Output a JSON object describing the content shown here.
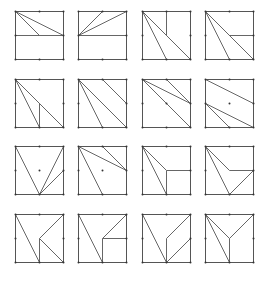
{
  "diagram": {
    "title": "",
    "grid": {
      "rows": 4,
      "cols": 4
    },
    "colors": {
      "stroke": "#555555",
      "dot": "#333333",
      "background": "#ffffff"
    },
    "col_x": [
      15,
      78,
      142,
      205
    ],
    "row_y": [
      11,
      79,
      146,
      214
    ],
    "size": 48,
    "note": "Each tile is a square with corner/edge-midpoint coordinates on a 0-2 grid (0=left/top, 1=middle, 2=right/bottom). 'segments' are interior dissection lines.",
    "tiles": [
      {
        "id": "r1c1",
        "dots": [
          "edges"
        ],
        "segments": [
          [
            [
              0,
              0
            ],
            [
              1,
              1
            ]
          ],
          [
            [
              0,
              0
            ],
            [
              2,
              1
            ]
          ],
          [
            [
              0,
              1
            ],
            [
              2,
              1
            ]
          ]
        ]
      },
      {
        "id": "r1c2",
        "dots": [
          "edges"
        ],
        "segments": [
          [
            [
              0,
              1
            ],
            [
              1,
              0
            ]
          ],
          [
            [
              0,
              1
            ],
            [
              2,
              0
            ]
          ],
          [
            [
              0,
              1
            ],
            [
              2,
              1
            ]
          ]
        ]
      },
      {
        "id": "r1c3",
        "dots": [
          "edges"
        ],
        "segments": [
          [
            [
              0,
              0
            ],
            [
              1,
              2
            ]
          ],
          [
            [
              0,
              0
            ],
            [
              2,
              2
            ]
          ],
          [
            [
              1,
              0
            ],
            [
              1,
              1
            ]
          ]
        ]
      },
      {
        "id": "r1c4",
        "dots": [
          "edges"
        ],
        "segments": [
          [
            [
              0,
              0
            ],
            [
              1,
              2
            ]
          ],
          [
            [
              0,
              0
            ],
            [
              2,
              2
            ]
          ],
          [
            [
              1,
              1
            ],
            [
              2,
              1
            ]
          ]
        ]
      },
      {
        "id": "r2c1",
        "dots": [
          "edges"
        ],
        "segments": [
          [
            [
              0,
              0
            ],
            [
              1,
              2
            ]
          ],
          [
            [
              0,
              0
            ],
            [
              2,
              2
            ]
          ],
          [
            [
              1,
              1
            ],
            [
              1,
              2
            ]
          ]
        ]
      },
      {
        "id": "r2c2",
        "dots": [
          "edges"
        ],
        "segments": [
          [
            [
              0,
              0
            ],
            [
              1,
              2
            ]
          ],
          [
            [
              0,
              0
            ],
            [
              2,
              2
            ]
          ],
          [
            [
              1,
              0
            ],
            [
              2,
              1
            ]
          ]
        ]
      },
      {
        "id": "r2c3",
        "dots": [
          "edges",
          "center"
        ],
        "segments": [
          [
            [
              0,
              0
            ],
            [
              2,
              1
            ]
          ],
          [
            [
              1,
              0
            ],
            [
              2,
              1
            ]
          ],
          [
            [
              0,
              0
            ],
            [
              2,
              2
            ]
          ]
        ]
      },
      {
        "id": "r2c4",
        "dots": [
          "edges",
          "center"
        ],
        "segments": [
          [
            [
              0,
              0
            ],
            [
              2,
              1
            ]
          ],
          [
            [
              0,
              1
            ],
            [
              2,
              2
            ]
          ],
          [
            [
              0,
              1
            ],
            [
              1,
              2
            ]
          ]
        ]
      },
      {
        "id": "r3c1",
        "dots": [
          "edges",
          "center"
        ],
        "segments": [
          [
            [
              0,
              0
            ],
            [
              1,
              2
            ]
          ],
          [
            [
              2,
              0
            ],
            [
              1,
              2
            ]
          ],
          [
            [
              2,
              1
            ],
            [
              1,
              2
            ]
          ]
        ]
      },
      {
        "id": "r3c2",
        "dots": [
          "edges",
          "center"
        ],
        "segments": [
          [
            [
              0,
              0
            ],
            [
              1,
              2
            ]
          ],
          [
            [
              0,
              0
            ],
            [
              2,
              1
            ]
          ],
          [
            [
              1,
              0
            ],
            [
              2,
              1
            ]
          ]
        ]
      },
      {
        "id": "r3c3",
        "dots": [
          "edges"
        ],
        "segments": [
          [
            [
              0,
              0
            ],
            [
              1,
              2
            ]
          ],
          [
            [
              0,
              0
            ],
            [
              1,
              1
            ]
          ],
          [
            [
              1,
              1
            ],
            [
              2,
              1
            ]
          ],
          [
            [
              1,
              1
            ],
            [
              1,
              2
            ]
          ]
        ]
      },
      {
        "id": "r3c4",
        "dots": [
          "edges"
        ],
        "segments": [
          [
            [
              0,
              0
            ],
            [
              1,
              2
            ]
          ],
          [
            [
              0,
              0
            ],
            [
              1,
              1
            ]
          ],
          [
            [
              1,
              1
            ],
            [
              2,
              1
            ]
          ],
          [
            [
              2,
              1
            ],
            [
              1,
              2
            ]
          ]
        ]
      },
      {
        "id": "r4c1",
        "dots": [
          "edges"
        ],
        "segments": [
          [
            [
              0,
              0
            ],
            [
              1,
              2
            ]
          ],
          [
            [
              2,
              0
            ],
            [
              1,
              1
            ]
          ],
          [
            [
              1,
              1
            ],
            [
              1,
              2
            ]
          ],
          [
            [
              1,
              1
            ],
            [
              2,
              2
            ]
          ]
        ]
      },
      {
        "id": "r4c2",
        "dots": [
          "edges"
        ],
        "segments": [
          [
            [
              0,
              0
            ],
            [
              1,
              2
            ]
          ],
          [
            [
              2,
              0
            ],
            [
              1,
              1
            ]
          ],
          [
            [
              1,
              1
            ],
            [
              2,
              1
            ]
          ],
          [
            [
              1,
              1
            ],
            [
              1,
              2
            ]
          ]
        ]
      },
      {
        "id": "r4c3",
        "dots": [
          "edges"
        ],
        "segments": [
          [
            [
              0,
              0
            ],
            [
              1,
              2
            ]
          ],
          [
            [
              2,
              0
            ],
            [
              1,
              1
            ]
          ],
          [
            [
              1,
              1
            ],
            [
              1,
              2
            ]
          ],
          [
            [
              2,
              1
            ],
            [
              1,
              2
            ]
          ]
        ]
      },
      {
        "id": "r4c4",
        "dots": [
          "edges"
        ],
        "segments": [
          [
            [
              0,
              0
            ],
            [
              1,
              2
            ]
          ],
          [
            [
              0,
              0
            ],
            [
              1,
              1
            ]
          ],
          [
            [
              2,
              0
            ],
            [
              1,
              1
            ]
          ],
          [
            [
              1,
              1
            ],
            [
              1,
              2
            ]
          ]
        ]
      }
    ]
  }
}
